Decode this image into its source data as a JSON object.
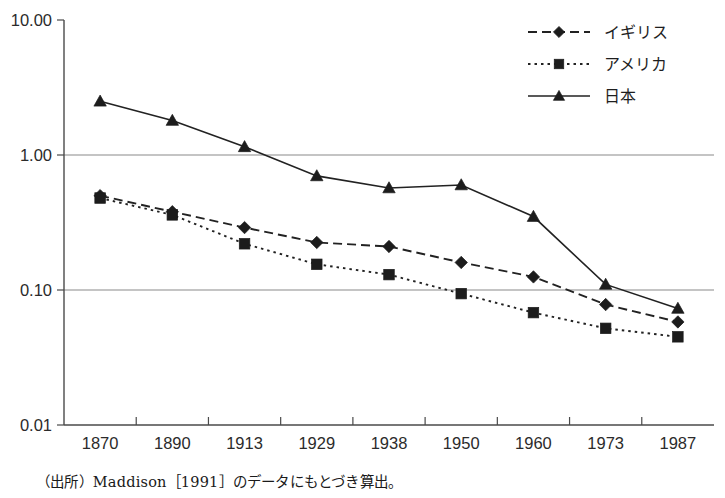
{
  "chart_data": {
    "type": "line",
    "title": "",
    "xlabel": "",
    "ylabel": "",
    "yscale": "log",
    "ylim": [
      0.01,
      10.0
    ],
    "grid": "horizontal gridlines at 1.00 and 0.10",
    "legend_position": "top-right",
    "categories": [
      "1870",
      "1890",
      "1913",
      "1929",
      "1938",
      "1950",
      "1960",
      "1973",
      "1987"
    ],
    "ytick_labels": [
      "10.00",
      "1.00",
      "0.10",
      "0.01"
    ],
    "ytick_values": [
      10.0,
      1.0,
      0.1,
      0.01
    ],
    "series": [
      {
        "name": "イギリス",
        "marker": "diamond",
        "linestyle": "dashed",
        "values": [
          0.5,
          0.38,
          0.29,
          0.225,
          0.21,
          0.16,
          0.125,
          0.078,
          0.058
        ]
      },
      {
        "name": "アメリカ",
        "marker": "square",
        "linestyle": "dotted",
        "values": [
          0.48,
          0.36,
          0.22,
          0.155,
          0.13,
          0.094,
          0.068,
          0.052,
          0.045
        ]
      },
      {
        "name": "日本",
        "marker": "triangle",
        "linestyle": "solid",
        "values": [
          2.5,
          1.8,
          1.15,
          0.7,
          0.57,
          0.6,
          0.35,
          0.11,
          0.073
        ]
      }
    ]
  },
  "legend": {
    "items": [
      {
        "label": "イギリス",
        "marker": "diamond",
        "linestyle": "dashed"
      },
      {
        "label": "アメリカ",
        "marker": "square",
        "linestyle": "dotted"
      },
      {
        "label": "日本",
        "marker": "triangle",
        "linestyle": "solid"
      }
    ]
  },
  "source": {
    "note": "（出所）Maddison［1991］のデータにもとづき算出。"
  },
  "colors": {
    "ink": "#1c1c1c",
    "axis": "#4a4a4a",
    "grid": "#8a8a8a",
    "background": "#ffffff"
  }
}
